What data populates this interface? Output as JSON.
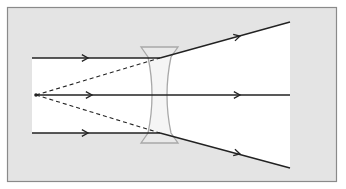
{
  "diagram": {
    "colors": {
      "background": "#ffffff",
      "frame_fill": "#e4e4e4",
      "frame_border": "#8a8a8a",
      "beam_fill": "#ffffff",
      "ray": "#222222",
      "lens_stroke": "#a8a8a8",
      "lens_fill": "#ececec"
    },
    "frame": {
      "x": 7,
      "y": 7,
      "width": 330,
      "height": 175
    },
    "focal_point": {
      "x": 36,
      "y": 95
    },
    "lens": {
      "type": "concave",
      "top_y": 47,
      "bottom_y": 143,
      "left_x": 141,
      "right_x": 178,
      "waist_left_x": 150,
      "waist_right_x": 167
    },
    "rays": [
      {
        "name": "top",
        "incoming": [
          [
            32,
            58
          ],
          [
            160,
            58
          ]
        ],
        "outgoing": [
          [
            160,
            58
          ],
          [
            290,
            22
          ]
        ],
        "arrow_in": [
          88,
          58
        ],
        "arrow_out": [
          240,
          36
        ]
      },
      {
        "name": "middle",
        "incoming": [
          [
            36,
            95
          ],
          [
            160,
            95
          ]
        ],
        "outgoing": [
          [
            160,
            95
          ],
          [
            290,
            95
          ]
        ],
        "arrow_in": [
          92,
          95
        ],
        "arrow_out": [
          240,
          95
        ]
      },
      {
        "name": "bottom",
        "incoming": [
          [
            32,
            133
          ],
          [
            160,
            133
          ]
        ],
        "outgoing": [
          [
            160,
            133
          ],
          [
            290,
            168
          ]
        ],
        "arrow_in": [
          88,
          133
        ],
        "arrow_out": [
          240,
          154
        ]
      }
    ],
    "virtual_rays": [
      {
        "name": "top-extension",
        "from": [
          36,
          95
        ],
        "to": [
          160,
          58
        ]
      },
      {
        "name": "bottom-extension",
        "from": [
          36,
          95
        ],
        "to": [
          160,
          133
        ]
      }
    ]
  }
}
